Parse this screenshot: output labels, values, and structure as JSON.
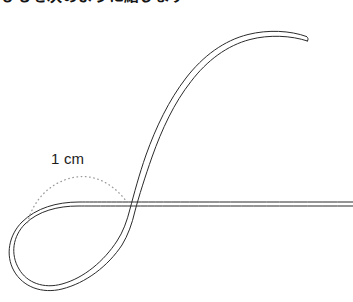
{
  "page": {
    "width": 353,
    "height": 302,
    "background": "#ffffff"
  },
  "heading": {
    "text": "ひもを次のように結びます",
    "clipped": true,
    "color": "#141414"
  },
  "figure": {
    "stroke_color": "#2b2b2b",
    "stroke_width": 1,
    "ribbon_gap": 4.5,
    "dotted_color": "#8a8a8a",
    "parts": [
      "teardrop-loop",
      "self-crossing",
      "horizontal-run",
      "s-curve-sweep",
      "blunt-end-cap"
    ]
  },
  "annotation": {
    "measure_label": "1 cm",
    "measure_arc": "dotted",
    "arc_color": "#9a9a9a"
  },
  "geometry": {
    "crossing_point": "130, 212",
    "loop_left_edge": "14, 240",
    "loop_bottom": "62, 286",
    "horizontal_line_y": "208, 213",
    "horizontal_right_end": "353",
    "curve_tip": "307, 38"
  }
}
